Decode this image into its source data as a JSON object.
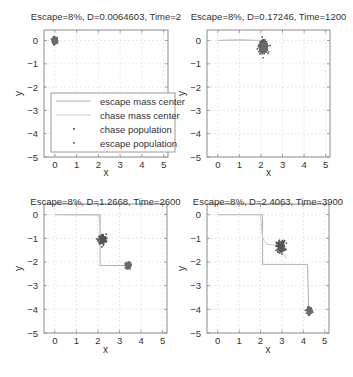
{
  "figure": {
    "width": 353,
    "height": 377,
    "colors": {
      "axis": "#8c8c8c",
      "grid": "#d4d4d4",
      "escape_line": "#b0b0b0",
      "chase_line": "#c8c8c8",
      "chase_population": "#555555",
      "escape_population": "#6b6b6b",
      "text": "#333333"
    }
  },
  "legend": {
    "panel": 0,
    "entries": [
      {
        "label": "escape mass center",
        "type": "line"
      },
      {
        "label": "chase mass center",
        "type": "line"
      },
      {
        "label": "chase population",
        "type": "marker"
      },
      {
        "label": "escape population",
        "type": "marker"
      }
    ]
  },
  "chart_data": [
    {
      "type": "scatter",
      "title": "Escape=8%, D=0.0064603, Time=2",
      "xlabel": "x",
      "ylabel": "y",
      "xlim": [
        -0.5,
        5.2
      ],
      "ylim": [
        -5,
        0.45
      ],
      "xticks": [
        0,
        1,
        2,
        3,
        4,
        5
      ],
      "yticks": [
        0,
        -1,
        -2,
        -3,
        -4,
        -5
      ],
      "grid": true,
      "legend_position": "lower right (inside)",
      "series": [
        {
          "name": "escape mass center",
          "points": [
            [
              0,
              0
            ],
            [
              0.01,
              0.0
            ]
          ]
        },
        {
          "name": "chase mass center",
          "points": [
            [
              0,
              0
            ],
            [
              0.005,
              0.0
            ]
          ]
        },
        {
          "name": "chase population",
          "clusters": [
            {
              "center": [
                0.0,
                0.0
              ],
              "spread": 0.12
            }
          ]
        },
        {
          "name": "escape population",
          "clusters": [
            {
              "center": [
                0.0,
                0.0
              ],
              "spread": 0.1
            }
          ]
        }
      ]
    },
    {
      "type": "scatter",
      "title": "Escape=8%, D=0.17246, Time=1200",
      "xlabel": "x",
      "ylabel": "y",
      "xlim": [
        -0.5,
        5.2
      ],
      "ylim": [
        -5,
        0.45
      ],
      "xticks": [
        0,
        1,
        2,
        3,
        4,
        5
      ],
      "yticks": [
        0,
        -1,
        -2,
        -3,
        -4,
        -5
      ],
      "grid": true,
      "series": [
        {
          "name": "escape mass center",
          "points": [
            [
              0,
              0
            ],
            [
              1.0,
              0.02
            ],
            [
              1.9,
              0.0
            ],
            [
              2.05,
              -0.1
            ],
            [
              2.1,
              -0.25
            ]
          ]
        },
        {
          "name": "chase mass center",
          "points": [
            [
              0,
              0
            ],
            [
              0.8,
              0.03
            ],
            [
              1.95,
              0.0
            ],
            [
              2.08,
              -0.15
            ]
          ]
        },
        {
          "name": "chase population",
          "clusters": [
            {
              "center": [
                2.1,
                -0.25
              ],
              "spread": 0.22
            }
          ]
        },
        {
          "name": "escape population",
          "clusters": [
            {
              "center": [
                2.15,
                -0.3
              ],
              "spread": 0.2
            }
          ]
        }
      ]
    },
    {
      "type": "scatter",
      "title": "Escape=8%, D=1.2668, Time=2600",
      "xlabel": "x",
      "ylabel": "y",
      "xlim": [
        -0.5,
        5.2
      ],
      "ylim": [
        -5,
        0.45
      ],
      "xticks": [
        0,
        1,
        2,
        3,
        4,
        5
      ],
      "yticks": [
        0,
        -1,
        -2,
        -3,
        -4,
        -5
      ],
      "grid": true,
      "series": [
        {
          "name": "escape mass center",
          "points": [
            [
              0,
              0
            ],
            [
              2.1,
              0
            ],
            [
              2.1,
              -2.15
            ],
            [
              3.35,
              -2.15
            ]
          ]
        },
        {
          "name": "chase mass center",
          "points": [
            [
              0,
              0
            ],
            [
              2.05,
              -0.02
            ],
            [
              2.15,
              -1.05
            ]
          ]
        },
        {
          "name": "chase population",
          "clusters": [
            {
              "center": [
                2.2,
                -1.05
              ],
              "spread": 0.2
            }
          ]
        },
        {
          "name": "escape population",
          "clusters": [
            {
              "center": [
                3.4,
                -2.15
              ],
              "spread": 0.12
            }
          ]
        }
      ]
    },
    {
      "type": "scatter",
      "title": "Escape=8%, D=2.4063, Time=3900",
      "xlabel": "x",
      "ylabel": "y",
      "xlim": [
        -0.5,
        5.2
      ],
      "ylim": [
        -5,
        0.45
      ],
      "xticks": [
        0,
        1,
        2,
        3,
        4,
        5
      ],
      "yticks": [
        0,
        -1,
        -2,
        -3,
        -4,
        -5
      ],
      "grid": true,
      "series": [
        {
          "name": "escape mass center",
          "points": [
            [
              0,
              0
            ],
            [
              2.1,
              0
            ],
            [
              2.1,
              -2.1
            ],
            [
              4.2,
              -2.1
            ],
            [
              4.25,
              -4.05
            ]
          ]
        },
        {
          "name": "chase mass center",
          "points": [
            [
              0,
              0
            ],
            [
              2.0,
              0
            ],
            [
              2.1,
              -1.0
            ],
            [
              2.3,
              -1.25
            ],
            [
              2.85,
              -1.3
            ],
            [
              3.2,
              -1.85
            ]
          ]
        },
        {
          "name": "chase population",
          "clusters": [
            {
              "center": [
                2.95,
                -1.35
              ],
              "spread": 0.22
            }
          ]
        },
        {
          "name": "escape population",
          "clusters": [
            {
              "center": [
                4.3,
                -4.05
              ],
              "spread": 0.12
            }
          ]
        }
      ]
    }
  ],
  "panels_layout": [
    {
      "box": [
        44,
        30,
        168,
        157
      ],
      "title_y": 12,
      "xlabel_y": 176,
      "ylabel_x": 19
    },
    {
      "box": [
        207,
        30,
        330,
        157
      ],
      "title_y": 12,
      "xlabel_y": 176,
      "ylabel_x": 182
    },
    {
      "box": [
        44,
        204,
        167,
        333
      ],
      "title_y": 197,
      "xlabel_y": 353,
      "ylabel_x": 19
    },
    {
      "box": [
        207,
        204,
        329,
        333
      ],
      "title_y": 197,
      "xlabel_y": 353,
      "ylabel_x": 182
    }
  ]
}
